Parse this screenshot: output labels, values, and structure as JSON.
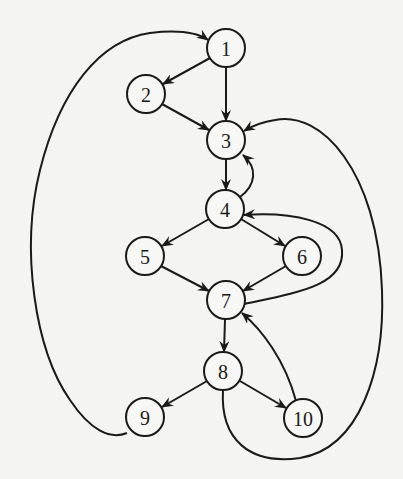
{
  "diagram": {
    "type": "directed-graph",
    "title": "",
    "colors": {
      "background": "#f4f4f2",
      "stroke": "#1a1a1a",
      "node_fill": "#f7f7f5"
    },
    "nodes": [
      {
        "id": "1",
        "label": "1",
        "x": 226,
        "y": 48
      },
      {
        "id": "2",
        "label": "2",
        "x": 146,
        "y": 94
      },
      {
        "id": "3",
        "label": "3",
        "x": 226,
        "y": 140
      },
      {
        "id": "4",
        "label": "4",
        "x": 225,
        "y": 209
      },
      {
        "id": "5",
        "label": "5",
        "x": 145,
        "y": 256
      },
      {
        "id": "6",
        "label": "6",
        "x": 302,
        "y": 256
      },
      {
        "id": "7",
        "label": "7",
        "x": 226,
        "y": 300
      },
      {
        "id": "8",
        "label": "8",
        "x": 223,
        "y": 371
      },
      {
        "id": "9",
        "label": "9",
        "x": 145,
        "y": 417
      },
      {
        "id": "10",
        "label": "10",
        "x": 303,
        "y": 418
      }
    ],
    "edges": [
      {
        "from": "1",
        "to": "2"
      },
      {
        "from": "1",
        "to": "3"
      },
      {
        "from": "2",
        "to": "3"
      },
      {
        "from": "3",
        "to": "4"
      },
      {
        "from": "4",
        "to": "3"
      },
      {
        "from": "4",
        "to": "5"
      },
      {
        "from": "4",
        "to": "6"
      },
      {
        "from": "5",
        "to": "7"
      },
      {
        "from": "6",
        "to": "7"
      },
      {
        "from": "7",
        "to": "4"
      },
      {
        "from": "7",
        "to": "8"
      },
      {
        "from": "8",
        "to": "9"
      },
      {
        "from": "8",
        "to": "10"
      },
      {
        "from": "10",
        "to": "7"
      },
      {
        "from": "8",
        "to": "3"
      },
      {
        "from": "9",
        "to": "1"
      }
    ]
  }
}
